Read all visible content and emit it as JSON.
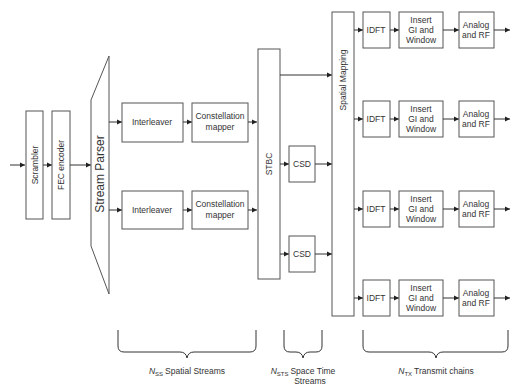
{
  "diagram": {
    "blocks": {
      "scrambler": "Scrambler",
      "fec_encoder": "FEC encoder",
      "stream_parser": "Stream Parser",
      "interleaver": "Interleaver",
      "constellation_line1": "Constellation",
      "constellation_line2": "mapper",
      "stbc": "STBC",
      "csd": "CSD",
      "spatial_mapping": "Spatial Mapping",
      "idft": "IDFT",
      "insert_gi_line1": "Insert",
      "insert_gi_line2": "GI and",
      "insert_gi_line3": "Window",
      "analog_line1": "Analog",
      "analog_line2": "and RF"
    },
    "braces": {
      "spatial_streams": {
        "symbol": "N",
        "subscript": "SS",
        "text": "Spatial Streams"
      },
      "space_time_streams": {
        "symbol": "N",
        "subscript": "STS",
        "text_line1": "Space Time",
        "text_line2": "Streams"
      },
      "transmit_chains": {
        "symbol": "N",
        "subscript": "TX",
        "text": "Transmit chains"
      }
    },
    "counts": {
      "spatial_streams": 2,
      "space_time_streams": 3,
      "transmit_chains": 4
    }
  }
}
